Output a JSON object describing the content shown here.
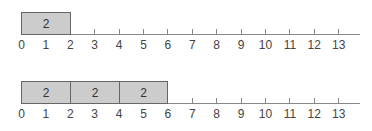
{
  "axis": {
    "ticks": [
      "0",
      "1",
      "2",
      "3",
      "4",
      "5",
      "6",
      "7",
      "8",
      "9",
      "10",
      "11",
      "12",
      "13"
    ]
  },
  "panels": [
    {
      "id": "top",
      "blocks": [
        {
          "start": 0,
          "end": 2,
          "label": "2"
        }
      ]
    },
    {
      "id": "bottom",
      "blocks": [
        {
          "start": 0,
          "end": 2,
          "label": "2"
        },
        {
          "start": 2,
          "end": 4,
          "label": "2"
        },
        {
          "start": 4,
          "end": 6,
          "label": "2"
        }
      ]
    }
  ],
  "colors": {
    "block_fill": "#cccccc",
    "block_border": "#666666",
    "axis": "#888888"
  }
}
